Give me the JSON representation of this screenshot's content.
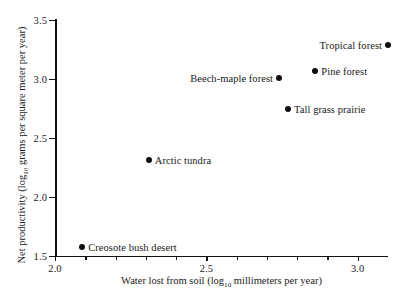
{
  "chart_data": {
    "type": "scatter",
    "title": "",
    "xlabel": "Water lost from soil (log10 millimeters per year)",
    "ylabel": "Net productivity (log10 grams per square meter per year)",
    "xlim": [
      2.0,
      3.1
    ],
    "ylim": [
      1.5,
      3.5
    ],
    "grid": false,
    "legend": "none",
    "x_ticks": [
      2.0,
      2.5,
      3.0
    ],
    "x_tick_labels": [
      "2.0",
      "2.5",
      "3.0"
    ],
    "x_minor_ticks": [
      2.1,
      2.2,
      2.3,
      2.4,
      2.6,
      2.7,
      2.8,
      2.9
    ],
    "y_ticks": [
      1.5,
      2.0,
      2.5,
      3.0,
      3.5
    ],
    "y_tick_labels": [
      "1.5",
      "2.0",
      "2.5",
      "3.0",
      "3.5"
    ],
    "points": [
      {
        "label": "Creosote bush desert",
        "x": 2.09,
        "y": 1.58,
        "label_side": "right"
      },
      {
        "label": "Arctic tundra",
        "x": 2.31,
        "y": 2.31,
        "label_side": "right"
      },
      {
        "label": "Tall grass prairie",
        "x": 2.77,
        "y": 2.75,
        "label_side": "right"
      },
      {
        "label": "Beech-maple forest",
        "x": 2.74,
        "y": 3.01,
        "label_side": "left"
      },
      {
        "label": "Pine forest",
        "x": 2.86,
        "y": 3.07,
        "label_side": "right"
      },
      {
        "label": "Tropical forest",
        "x": 3.1,
        "y": 3.29,
        "label_side": "left"
      }
    ]
  },
  "axis_titles": {
    "x_prefix": "Water lost from soil (log",
    "x_sub": "10",
    "x_suffix": " millimeters per year)",
    "y_prefix": "Net productivity (log",
    "y_sub": "10",
    "y_suffix": " grams per square meter per year)"
  },
  "colors": {
    "axis": "#111111",
    "marker": "#0d0d0d",
    "text": "#1a1a1a",
    "background": "#ffffff"
  }
}
